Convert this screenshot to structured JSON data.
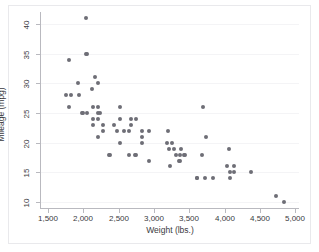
{
  "figure": {
    "background_color": "#ffffff",
    "frame_color": "#e9e9ec",
    "axis_color": "#b9b9bf",
    "grid_color": "#f4f4f6",
    "marker_color": "#6e6e76"
  },
  "chart_data": {
    "type": "scatter",
    "title": "",
    "xlabel": "Weight (lbs.)",
    "ylabel": "Mileage (mpg)",
    "xlim": [
      1400,
      5050
    ],
    "ylim": [
      9,
      42
    ],
    "grid": true,
    "grid_axis": "y",
    "legend": "none",
    "xticks": [
      1500,
      2000,
      2500,
      3000,
      3500,
      4000,
      4500,
      5000
    ],
    "xticklabels": [
      "1,500",
      "2,000",
      "2,500",
      "3,000",
      "3,500",
      "4,000",
      "4,500",
      "5,000"
    ],
    "yticks": [
      10,
      15,
      20,
      25,
      30,
      35,
      40
    ],
    "yticklabels": [
      "10",
      "15",
      "20",
      "25",
      "30",
      "35",
      "40"
    ],
    "series": [
      {
        "name": "Mileage (mpg) vs Weight (lbs.)",
        "marker": "circle",
        "color": "#6e6e76",
        "points": [
          [
            2930,
            22
          ],
          [
            3350,
            17
          ],
          [
            2640,
            22
          ],
          [
            3250,
            20
          ],
          [
            4080,
            15
          ],
          [
            3670,
            18
          ],
          [
            3690,
            26
          ],
          [
            3180,
            20
          ],
          [
            3220,
            16
          ],
          [
            4060,
            19
          ],
          [
            3600,
            14
          ],
          [
            3600,
            14
          ],
          [
            3740,
            21
          ],
          [
            4840,
            10
          ],
          [
            4720,
            11
          ],
          [
            3830,
            14
          ],
          [
            4130,
            15
          ],
          [
            4370,
            15
          ],
          [
            4034,
            16
          ],
          [
            4080,
            14
          ],
          [
            3720,
            14
          ],
          [
            3370,
            17
          ],
          [
            4130,
            16
          ],
          [
            2830,
            20
          ],
          [
            2200,
            26
          ],
          [
            2520,
            20
          ],
          [
            2130,
            24
          ],
          [
            2650,
            18
          ],
          [
            1800,
            26
          ],
          [
            2730,
            18
          ],
          [
            2360,
            18
          ],
          [
            2930,
            17
          ],
          [
            2470,
            22
          ],
          [
            2830,
            21
          ],
          [
            2200,
            25
          ],
          [
            2670,
            24
          ],
          [
            2750,
            24
          ],
          [
            2280,
            23
          ],
          [
            2430,
            23
          ],
          [
            2670,
            23
          ],
          [
            3280,
            19
          ],
          [
            2750,
            18
          ],
          [
            3430,
            18
          ],
          [
            3210,
            19
          ],
          [
            3380,
            19
          ],
          [
            2200,
            24
          ],
          [
            2520,
            26
          ],
          [
            1830,
            28
          ],
          [
            2050,
            25
          ],
          [
            1920,
            30
          ],
          [
            2580,
            22
          ],
          [
            2200,
            30
          ],
          [
            2520,
            24
          ],
          [
            2240,
            25
          ],
          [
            2130,
            26
          ],
          [
            1760,
            28
          ],
          [
            2050,
            35
          ],
          [
            2120,
            29
          ],
          [
            1800,
            34
          ],
          [
            2160,
            31
          ],
          [
            2040,
            35
          ],
          [
            1930,
            28
          ],
          [
            1990,
            25
          ],
          [
            3420,
            18
          ],
          [
            3195,
            22
          ],
          [
            3310,
            18
          ],
          [
            3370,
            18
          ],
          [
            2830,
            22
          ],
          [
            2200,
            21
          ],
          [
            2370,
            18
          ],
          [
            2280,
            22
          ],
          [
            2030,
            41
          ],
          [
            1980,
            25
          ],
          [
            2130,
            23
          ]
        ]
      }
    ]
  }
}
